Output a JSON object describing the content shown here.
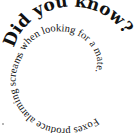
{
  "spiral": {
    "headline": "Did you know?",
    "body": "Foxes produce alarming screams when looking for a mate.",
    "text_color": "#111111",
    "background": "#ffffff"
  }
}
